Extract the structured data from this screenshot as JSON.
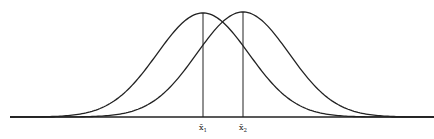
{
  "diagram": {
    "type": "overlapping-normal-distributions",
    "stroke_color": "#222222",
    "background": "#ffffff",
    "axis": {
      "x1": 10,
      "x2": 434,
      "y": 117
    },
    "curves": [
      {
        "name": "distribution-1",
        "mean_x": 203,
        "peak_y": 13,
        "sigma_px": 46
      },
      {
        "name": "distribution-2",
        "mean_x": 243,
        "peak_y": 12,
        "sigma_px": 46
      }
    ],
    "markers": [
      {
        "x": 203,
        "label": "x̄",
        "subscript": "1"
      },
      {
        "x": 243,
        "label": "x̄",
        "subscript": "2"
      }
    ]
  }
}
